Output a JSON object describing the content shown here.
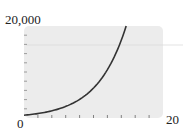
{
  "chart_data": {
    "type": "line",
    "title": "",
    "xlabel": "",
    "ylabel": "",
    "xlim": [
      0,
      20
    ],
    "ylim": [
      0,
      20000
    ],
    "x_tick_step": 2,
    "y_tick_step": 2000,
    "tick_labels": {
      "y_max": "20,000",
      "origin": "0",
      "x_max": "20"
    },
    "grid": false,
    "series": [
      {
        "name": "exponential growth curve",
        "x": [
          0,
          2,
          4,
          6,
          8,
          10,
          12,
          14,
          14.7
        ],
        "values": [
          600,
          970,
          1550,
          2500,
          4030,
          6480,
          10420,
          16750,
          20000
        ]
      }
    ],
    "colors": {
      "plot_background": "#ececec",
      "curve": "#333333"
    }
  }
}
